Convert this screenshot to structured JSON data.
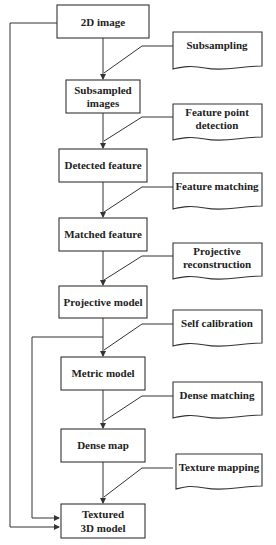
{
  "diagram": {
    "title": "",
    "process_boxes": [
      {
        "id": "2d-image",
        "lines": [
          "2D image"
        ]
      },
      {
        "id": "subsampled-images",
        "lines": [
          "Subsampled",
          "images"
        ]
      },
      {
        "id": "detected-feature",
        "lines": [
          "Detected feature"
        ]
      },
      {
        "id": "matched-feature",
        "lines": [
          "Matched feature"
        ]
      },
      {
        "id": "projective-model",
        "lines": [
          "Projective model"
        ]
      },
      {
        "id": "metric-model",
        "lines": [
          "Metric model"
        ]
      },
      {
        "id": "dense-map",
        "lines": [
          "Dense map"
        ]
      },
      {
        "id": "textured-3d-model",
        "lines": [
          "Textured",
          "3D model"
        ]
      }
    ],
    "document_boxes": [
      {
        "id": "subsampling",
        "lines": [
          "Subsampling"
        ]
      },
      {
        "id": "feature-point-detection",
        "lines": [
          "Feature point",
          "detection"
        ]
      },
      {
        "id": "feature-matching",
        "lines": [
          "Feature matching"
        ]
      },
      {
        "id": "projective-reconstruction",
        "lines": [
          "Projective",
          "reconstruction"
        ]
      },
      {
        "id": "self-calibration",
        "lines": [
          "Self calibration"
        ]
      },
      {
        "id": "dense-matching",
        "lines": [
          "Dense matching"
        ]
      },
      {
        "id": "texture-mapping",
        "lines": [
          "Texture mapping"
        ]
      }
    ],
    "colors": {
      "line": "#333333",
      "text": "#222222",
      "background": "#ffffff"
    }
  }
}
